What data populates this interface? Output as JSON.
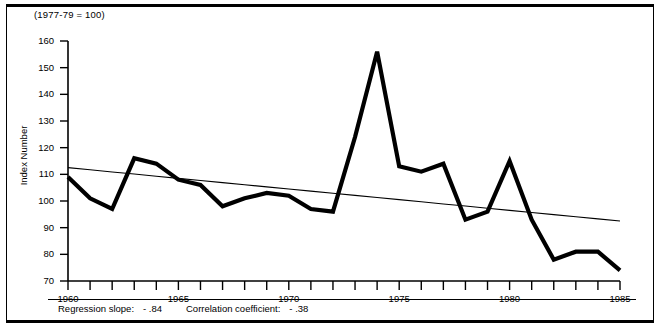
{
  "figure": {
    "units_note": "(1977-79 = 100)",
    "y_axis_title": "Index Number"
  },
  "caption": {
    "slope_label": "Regression slope:",
    "slope_value": "- .84",
    "corr_label": "Correlation coefficient:",
    "corr_value": "- .38"
  },
  "chart_data": {
    "type": "line",
    "title": "",
    "subtitle": "(1977-79 = 100)",
    "xlabel": "",
    "ylabel": "Index Number",
    "xlim": [
      1960,
      1985
    ],
    "ylim": [
      70,
      160
    ],
    "grid": false,
    "legend": null,
    "x_ticks": [
      1960,
      1961,
      1962,
      1963,
      1964,
      1965,
      1966,
      1967,
      1968,
      1969,
      1970,
      1971,
      1972,
      1973,
      1974,
      1975,
      1976,
      1977,
      1978,
      1979,
      1980,
      1981,
      1982,
      1983,
      1984,
      1985
    ],
    "x_tick_labels": [
      "1960",
      "",
      "",
      "",
      "",
      "1965",
      "",
      "",
      "",
      "",
      "1970",
      "",
      "",
      "",
      "",
      "1975",
      "",
      "",
      "",
      "",
      "1980",
      "",
      "",
      "",
      "",
      "1985"
    ],
    "y_ticks": [
      70,
      80,
      90,
      100,
      110,
      120,
      130,
      140,
      150,
      160
    ],
    "y_tick_labels": [
      "70",
      "80",
      "90",
      "100",
      "110",
      "120",
      "130",
      "140",
      "150",
      "160"
    ],
    "x": [
      1960,
      1961,
      1962,
      1963,
      1964,
      1965,
      1966,
      1967,
      1968,
      1969,
      1970,
      1971,
      1972,
      1973,
      1974,
      1975,
      1976,
      1977,
      1978,
      1979,
      1980,
      1981,
      1982,
      1983,
      1984,
      1985
    ],
    "series": [
      {
        "name": "Index Number",
        "style": "thick-black-line",
        "values": [
          109,
          101,
          97,
          116,
          114,
          108,
          106,
          98,
          101,
          103,
          102,
          97,
          96,
          124,
          156,
          113,
          111,
          114,
          93,
          96,
          115,
          93,
          78,
          81,
          81,
          74
        ]
      },
      {
        "name": "Regression line",
        "style": "thin-black-line",
        "values": [
          112.5,
          111.7,
          110.9,
          110.1,
          109.3,
          108.5,
          107.7,
          106.9,
          106.1,
          105.3,
          104.5,
          103.7,
          102.9,
          102.1,
          101.3,
          100.5,
          99.7,
          98.9,
          98.1,
          97.3,
          96.5,
          95.7,
          94.9,
          94.1,
          93.3,
          92.5
        ]
      }
    ],
    "annotations": [
      "Regression slope: - .84",
      "Correlation coefficient: - .38"
    ]
  }
}
